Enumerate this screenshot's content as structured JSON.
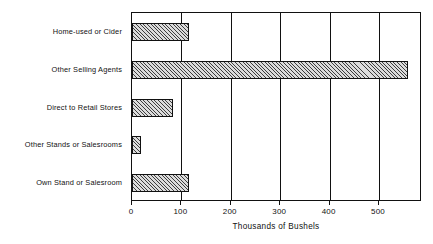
{
  "chart_data": {
    "type": "bar",
    "orientation": "horizontal",
    "title": "",
    "subtitle": "",
    "xlabel": "Thousands of Bushels",
    "ylabel": "",
    "categories": [
      "Home-used or Cider",
      "Other Selling Agents",
      "Direct to Retail Stores",
      "Other Stands or Salesrooms",
      "Own Stand or Salesroom"
    ],
    "values": [
      115,
      558,
      83,
      18,
      115
    ],
    "xlim": [
      0,
      587
    ],
    "xticks": [
      0,
      100,
      200,
      300,
      400,
      500
    ],
    "xtick_labels": [
      "0",
      "100",
      "200",
      "300",
      "400",
      "500"
    ],
    "grid": "vertical",
    "legend": "none",
    "bar_fill": "#dcdcdc",
    "bar_hatch": "diagonal-crosshatch",
    "bar_edge_color": "#111111",
    "axis_color": "#111111",
    "background": "#ffffff"
  },
  "axis": {
    "x_title": "Thousands of Bushels",
    "ticks": [
      {
        "label": "0",
        "value": 0
      },
      {
        "label": "100",
        "value": 100
      },
      {
        "label": "200",
        "value": 200
      },
      {
        "label": "300",
        "value": 300
      },
      {
        "label": "400",
        "value": 400
      },
      {
        "label": "500",
        "value": 500
      }
    ]
  },
  "bars": [
    {
      "label": "Home-used or Cider",
      "value": 115
    },
    {
      "label": "Other Selling Agents",
      "value": 558
    },
    {
      "label": "Direct to Retail Stores",
      "value": 83
    },
    {
      "label": "Other Stands or Salesrooms",
      "value": 18
    },
    {
      "label": "Own Stand or Salesroom",
      "value": 115
    }
  ]
}
